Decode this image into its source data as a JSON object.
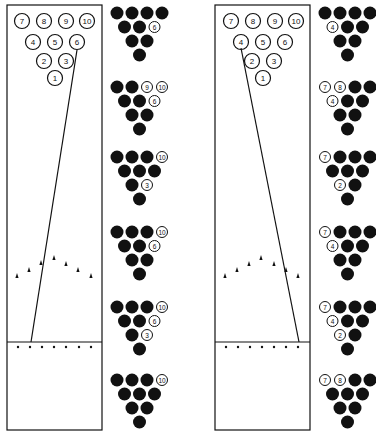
{
  "lanes": [
    {
      "id": "left",
      "label": "6-pin spare path lane",
      "x": 7,
      "y": 5,
      "width": 95,
      "foul_line_y": 342,
      "bottom_y": 430,
      "pins": [
        {
          "n": "7",
          "x": 22,
          "y": 21
        },
        {
          "n": "8",
          "x": 44,
          "y": 21
        },
        {
          "n": "9",
          "x": 66,
          "y": 21
        },
        {
          "n": "10",
          "x": 87,
          "y": 21
        },
        {
          "n": "4",
          "x": 33,
          "y": 42
        },
        {
          "n": "5",
          "x": 55,
          "y": 42
        },
        {
          "n": "6",
          "x": 77,
          "y": 42
        },
        {
          "n": "2",
          "x": 44,
          "y": 61
        },
        {
          "n": "3",
          "x": 66,
          "y": 61
        },
        {
          "n": "1",
          "x": 55,
          "y": 78
        }
      ],
      "ball_path": {
        "x1": 31,
        "y1": 342,
        "x2": 77,
        "y2": 50
      },
      "arrows": [
        {
          "x": 17,
          "y": 276
        },
        {
          "x": 29,
          "y": 270
        },
        {
          "x": 41,
          "y": 263
        },
        {
          "x": 54,
          "y": 258
        },
        {
          "x": 66,
          "y": 264
        },
        {
          "x": 78,
          "y": 270
        },
        {
          "x": 91,
          "y": 276
        }
      ],
      "dots": [
        {
          "x": 18,
          "y": 347
        },
        {
          "x": 30,
          "y": 347
        },
        {
          "x": 42,
          "y": 347
        },
        {
          "x": 54,
          "y": 347
        },
        {
          "x": 66,
          "y": 347
        },
        {
          "x": 79,
          "y": 347
        },
        {
          "x": 91,
          "y": 347
        }
      ]
    },
    {
      "id": "right",
      "label": "4-pin spare path lane",
      "x": 215,
      "y": 5,
      "width": 95,
      "foul_line_y": 342,
      "bottom_y": 430,
      "pins": [
        {
          "n": "7",
          "x": 231,
          "y": 21
        },
        {
          "n": "8",
          "x": 253,
          "y": 21
        },
        {
          "n": "9",
          "x": 275,
          "y": 21
        },
        {
          "n": "10",
          "x": 296,
          "y": 21
        },
        {
          "n": "4",
          "x": 241,
          "y": 42
        },
        {
          "n": "5",
          "x": 263,
          "y": 42
        },
        {
          "n": "6",
          "x": 285,
          "y": 42
        },
        {
          "n": "2",
          "x": 252,
          "y": 61
        },
        {
          "n": "3",
          "x": 274,
          "y": 61
        },
        {
          "n": "1",
          "x": 263,
          "y": 78
        }
      ],
      "ball_path": {
        "x1": 299,
        "y1": 342,
        "x2": 241,
        "y2": 48
      },
      "arrows": [
        {
          "x": 225,
          "y": 276
        },
        {
          "x": 237,
          "y": 270
        },
        {
          "x": 249,
          "y": 264
        },
        {
          "x": 261,
          "y": 258
        },
        {
          "x": 274,
          "y": 264
        },
        {
          "x": 286,
          "y": 270
        },
        {
          "x": 298,
          "y": 276
        }
      ],
      "dots": [
        {
          "x": 226,
          "y": 347
        },
        {
          "x": 238,
          "y": 347
        },
        {
          "x": 250,
          "y": 347
        },
        {
          "x": 262,
          "y": 347
        },
        {
          "x": 274,
          "y": 347
        },
        {
          "x": 286,
          "y": 347
        },
        {
          "x": 298,
          "y": 347
        }
      ]
    }
  ],
  "spare_racks": {
    "left_column": {
      "x": 111,
      "racks": [
        {
          "y": 6,
          "standing": [
            "6"
          ]
        },
        {
          "y": 80,
          "standing": [
            "9",
            "10",
            "6"
          ]
        },
        {
          "y": 150,
          "standing": [
            "10",
            "3"
          ]
        },
        {
          "y": 225,
          "standing": [
            "10",
            "6"
          ]
        },
        {
          "y": 300,
          "standing": [
            "10",
            "6",
            "3"
          ]
        },
        {
          "y": 373,
          "standing": [
            "10"
          ]
        }
      ]
    },
    "right_column": {
      "x": 319,
      "racks": [
        {
          "y": 6,
          "standing": [
            "4"
          ]
        },
        {
          "y": 80,
          "standing": [
            "7",
            "8",
            "4"
          ]
        },
        {
          "y": 150,
          "standing": [
            "7",
            "2"
          ]
        },
        {
          "y": 225,
          "standing": [
            "7",
            "4"
          ]
        },
        {
          "y": 300,
          "standing": [
            "7",
            "4",
            "2"
          ]
        },
        {
          "y": 373,
          "standing": [
            "7",
            "8"
          ]
        }
      ]
    }
  },
  "colors": {
    "ink": "#111111",
    "background": "#ffffff"
  }
}
